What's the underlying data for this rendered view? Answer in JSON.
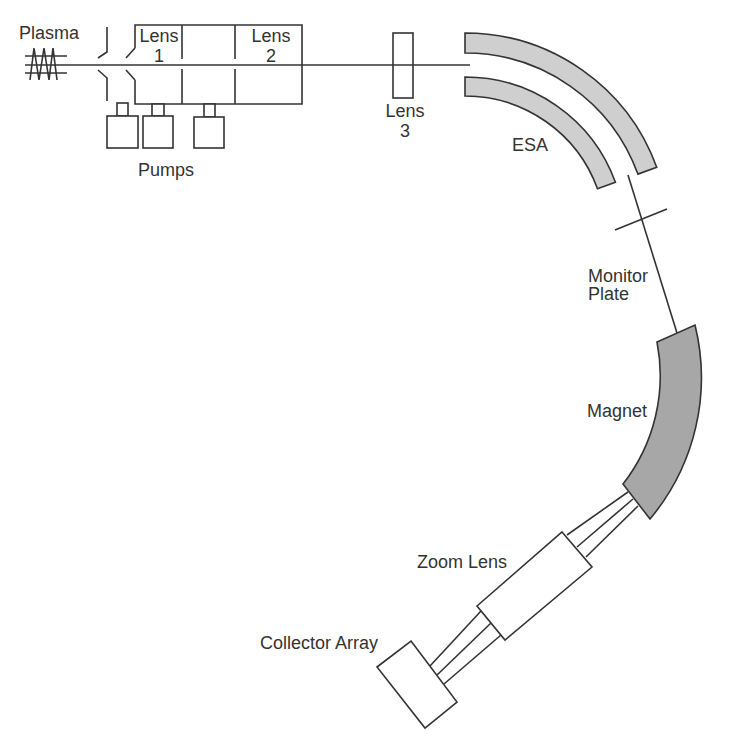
{
  "diagram": {
    "colors": {
      "line": "#333333",
      "esa_fill": "#cfcfcf",
      "magnet_fill": "#a7a7a7",
      "background": "#ffffff"
    },
    "labels": {
      "plasma": "Plasma",
      "lens1_word": "Lens",
      "lens1_num": "1",
      "lens2_word": "Lens",
      "lens2_num": "2",
      "lens3_word": "Lens",
      "lens3_num": "3",
      "pumps": "Pumps",
      "esa": "ESA",
      "monitor_line1": "Monitor",
      "monitor_line2": "Plate",
      "magnet": "Magnet",
      "zoom_lens": "Zoom Lens",
      "collector_array": "Collector Array"
    },
    "components": [
      "Plasma source (coil)",
      "Sampling slits",
      "Lens 1",
      "Lens 2",
      "Pumps (3)",
      "Lens 3",
      "ESA (electrostatic analyzer, 2 curved plates)",
      "Monitor Plate",
      "Magnet",
      "Zoom Lens",
      "Collector Array"
    ]
  }
}
